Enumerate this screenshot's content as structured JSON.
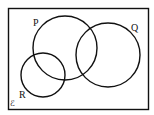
{
  "diagram": {
    "type": "venn",
    "universal_set_symbol": "ℰ",
    "sets": [
      {
        "label": "P"
      },
      {
        "label": "Q"
      },
      {
        "label": "R"
      }
    ],
    "stroke_color": "#111111",
    "background": "#ffffff"
  }
}
